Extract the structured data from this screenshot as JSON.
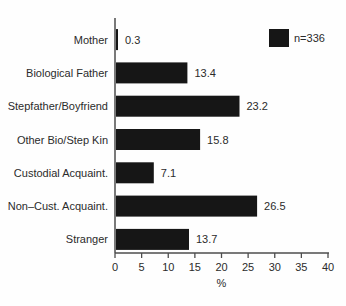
{
  "figure": {
    "kind": "scanned statistical bar chart figure"
  },
  "chart_data": {
    "type": "bar",
    "orientation": "horizontal",
    "categories": [
      "Mother",
      "Biological Father",
      "Stepfather/Boyfriend",
      "Other Bio/Step Kin",
      "Custodial Acquaint.",
      "Non–Cust. Acquaint.",
      "Stranger"
    ],
    "values": [
      0.3,
      13.4,
      23.2,
      15.8,
      7.1,
      26.5,
      13.7
    ],
    "value_labels": [
      "0.3",
      "13.4",
      "23.2",
      "15.8",
      "7.1",
      "26.5",
      "13.7"
    ],
    "title": "",
    "xlabel": "%",
    "ylabel": "",
    "xlim": [
      0,
      40
    ],
    "xticks": [
      0,
      5,
      10,
      15,
      20,
      25,
      30,
      35,
      40
    ],
    "xtick_labels": [
      "0",
      "5",
      "10",
      "15",
      "20",
      "25",
      "30",
      "35",
      "40"
    ],
    "grid": false,
    "legend": {
      "label": "n=336",
      "position": "top-right",
      "swatch_color": "#161616"
    },
    "colors": {
      "bar": "#161616",
      "axis": "#4d4d4d",
      "text": "#2b2b2b",
      "background": "#fefefe"
    }
  }
}
